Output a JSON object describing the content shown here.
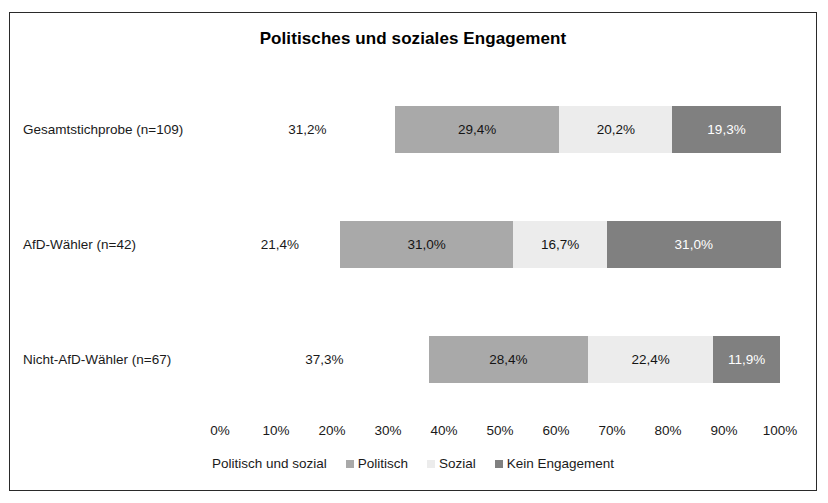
{
  "chart_data": {
    "type": "bar",
    "title": "Politisches und soziales Engagement",
    "orientation": "horizontal",
    "stacked": true,
    "stack_mode": "percent",
    "xlabel": "",
    "ylabel": "",
    "xlim": [
      0,
      100
    ],
    "grid": false,
    "legend_position": "bottom",
    "categories": [
      "Gesamtstichprobe (n=109)",
      "AfD-Wähler (n=42)",
      "Nicht-AfD-Wähler (n=67)"
    ],
    "tick_labels": [
      "0%",
      "10%",
      "20%",
      "30%",
      "40%",
      "50%",
      "60%",
      "70%",
      "80%",
      "90%",
      "100%"
    ],
    "tick_values": [
      0,
      10,
      20,
      30,
      40,
      50,
      60,
      70,
      80,
      90,
      100
    ],
    "series": [
      {
        "name": "Politisch und sozial",
        "color": "#ffffff",
        "values": [
          31.2,
          21.4,
          37.3
        ],
        "labels": [
          "31,2%",
          "21,4%",
          "37,3%"
        ]
      },
      {
        "name": "Politisch",
        "color": "#a9a9a9",
        "values": [
          29.4,
          31.0,
          28.4
        ],
        "labels": [
          "29,4%",
          "31,0%",
          "28,4%"
        ]
      },
      {
        "name": "Sozial",
        "color": "#ececec",
        "values": [
          20.2,
          16.7,
          22.4
        ],
        "labels": [
          "20,2%",
          "16,7%",
          "22,4%"
        ]
      },
      {
        "name": "Kein Engagement",
        "color": "#808080",
        "values": [
          19.3,
          31.0,
          11.9
        ],
        "labels": [
          "19,3%",
          "31,0%",
          "11,9%"
        ]
      }
    ]
  },
  "legend": {
    "items": [
      {
        "label": "Politisch und sozial",
        "color": "#ffffff",
        "show_swatch": false
      },
      {
        "label": "Politisch",
        "color": "#a9a9a9",
        "show_swatch": true
      },
      {
        "label": "Sozial",
        "color": "#ececec",
        "show_swatch": true
      },
      {
        "label": "Kein Engagement",
        "color": "#808080",
        "show_swatch": true
      }
    ]
  }
}
